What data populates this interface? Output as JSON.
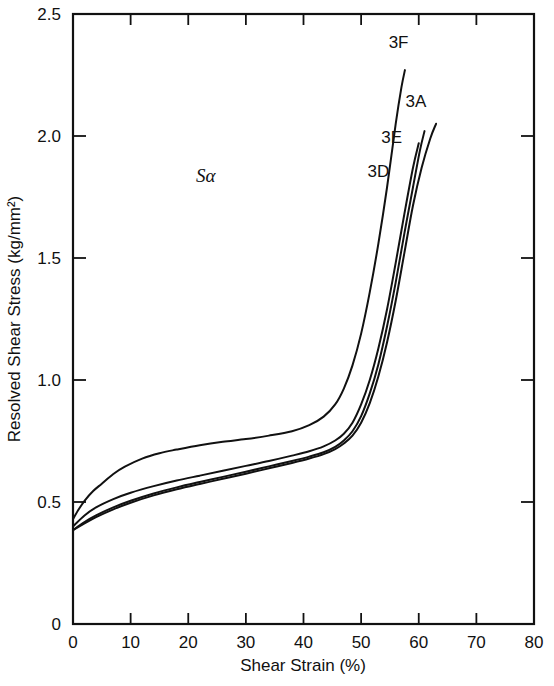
{
  "chart_data": {
    "type": "line",
    "title": "",
    "annotation": "Sα",
    "xlabel": "Shear Strain (%)",
    "ylabel": "Resolved Shear Stress (kg/mm²)",
    "xlim": [
      0,
      80
    ],
    "ylim": [
      0,
      2.5
    ],
    "xticks": [
      0,
      10,
      20,
      30,
      40,
      50,
      60,
      70,
      80
    ],
    "xticklabels": [
      "0",
      "10",
      "20",
      "30",
      "40",
      "50",
      "60",
      "70",
      "80"
    ],
    "yticks": [
      0,
      0.5,
      1.0,
      1.5,
      2.0,
      2.5
    ],
    "yticklabels": [
      "0",
      "0.5",
      "1.0",
      "1.5",
      "2.0",
      "2.5"
    ],
    "grid": false,
    "legend_position": "inline-curve-labels",
    "line_color": "#111111",
    "series": [
      {
        "name": "3F",
        "label_x": 56.5,
        "label_y": 2.36,
        "x": [
          0,
          1,
          2,
          3.5,
          5,
          7,
          9,
          12,
          15,
          18,
          22,
          26,
          30,
          34,
          38,
          41,
          43.5,
          45.5,
          47,
          48.5,
          50,
          51.5,
          53,
          54.5,
          56,
          57,
          57.6
        ],
        "y": [
          0.43,
          0.47,
          0.505,
          0.545,
          0.575,
          0.615,
          0.645,
          0.678,
          0.7,
          0.715,
          0.733,
          0.747,
          0.758,
          0.772,
          0.79,
          0.815,
          0.85,
          0.9,
          0.965,
          1.06,
          1.19,
          1.36,
          1.56,
          1.79,
          2.05,
          2.2,
          2.27
        ]
      },
      {
        "name": "3D",
        "label_x": 53.0,
        "label_y": 1.83,
        "x": [
          0,
          2,
          4,
          7,
          10,
          14,
          18,
          22,
          26,
          30,
          34,
          38,
          41,
          43.5,
          45.5,
          47,
          48.5,
          50,
          51.5,
          53,
          54.5,
          56,
          57.5,
          59,
          60
        ],
        "y": [
          0.4,
          0.445,
          0.478,
          0.512,
          0.538,
          0.565,
          0.588,
          0.608,
          0.628,
          0.648,
          0.668,
          0.69,
          0.708,
          0.728,
          0.752,
          0.78,
          0.825,
          0.9,
          1.0,
          1.13,
          1.29,
          1.48,
          1.68,
          1.87,
          1.97
        ]
      },
      {
        "name": "3E",
        "label_x": 55.3,
        "label_y": 1.97,
        "x": [
          0,
          2,
          4,
          7,
          10,
          14,
          18,
          22,
          26,
          30,
          34,
          38,
          41,
          43.5,
          45.5,
          47,
          48.5,
          50,
          51.5,
          53,
          54.5,
          56,
          57.5,
          59,
          60.2,
          61
        ],
        "y": [
          0.385,
          0.418,
          0.445,
          0.478,
          0.505,
          0.535,
          0.56,
          0.582,
          0.603,
          0.624,
          0.646,
          0.668,
          0.686,
          0.704,
          0.726,
          0.752,
          0.79,
          0.852,
          0.945,
          1.065,
          1.22,
          1.4,
          1.6,
          1.79,
          1.94,
          2.02
        ]
      },
      {
        "name": "3A",
        "label_x": 59.5,
        "label_y": 2.12,
        "x": [
          0,
          2,
          4,
          7,
          10,
          14,
          18,
          22,
          26,
          30,
          34,
          38,
          41,
          43.5,
          45.5,
          47,
          48.5,
          50,
          51.5,
          53,
          54.5,
          56,
          57.5,
          59,
          60.5,
          62,
          63
        ],
        "y": [
          0.385,
          0.412,
          0.438,
          0.47,
          0.497,
          0.527,
          0.552,
          0.574,
          0.595,
          0.616,
          0.638,
          0.66,
          0.678,
          0.696,
          0.717,
          0.74,
          0.772,
          0.825,
          0.905,
          1.015,
          1.155,
          1.325,
          1.52,
          1.715,
          1.87,
          1.99,
          2.05
        ]
      }
    ]
  }
}
